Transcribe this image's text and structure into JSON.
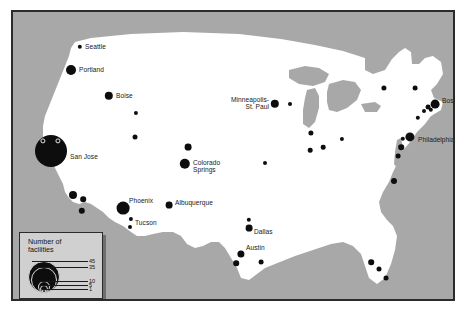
{
  "figure": {
    "kind": "thematic-map",
    "colors": {
      "page_background": "#ffffff",
      "ocean_background": "#a8a8a8",
      "land_fill": "#ffffff",
      "frame_border": "#2b2b2b",
      "symbol_fill": "#0d0d0d",
      "legend_background": "#d0d0d0",
      "legend_shadow": "#6f6f6f",
      "label_text": "#191919"
    }
  },
  "legend": {
    "title_line1": "Number of",
    "title_line2": "facilities",
    "breaks": [
      {
        "value": "45",
        "radius_px": 16.0
      },
      {
        "value": "35",
        "radius_px": 13.0
      },
      {
        "value": "10",
        "radius_px": 6.2
      },
      {
        "value": "5",
        "radius_px": 4.2
      },
      {
        "value": "1",
        "radius_px": 2.0
      }
    ]
  },
  "chart_data": {
    "type": "scatter",
    "xlabel": "",
    "ylabel": "",
    "symbol": "proportional-circle",
    "legend_position": "bottom-left",
    "points": [
      {
        "label": "Seattle",
        "x": 67,
        "y": 35,
        "r": 2.2,
        "label_pos": "right",
        "label_dx": 5,
        "label_dy": 0
      },
      {
        "label": "Portland",
        "x": 58,
        "y": 58,
        "r": 5.0,
        "label_pos": "right",
        "label_dx": 8,
        "label_dy": 0
      },
      {
        "label": "Boise",
        "x": 96,
        "y": 84,
        "r": 4.2,
        "label_pos": "right",
        "label_dx": 7,
        "label_dy": 0
      },
      {
        "label": "",
        "x": 123,
        "y": 101,
        "r": 2.1,
        "label_pos": "right",
        "label_dx": 0,
        "label_dy": 0
      },
      {
        "label": "",
        "x": 122,
        "y": 125,
        "r": 2.5,
        "label_pos": "right",
        "label_dx": 0,
        "label_dy": 0
      },
      {
        "label": "San Jose",
        "x": 38,
        "y": 139,
        "r": 16.0,
        "label_pos": "right",
        "label_dx": 19,
        "label_dy": 6
      },
      {
        "label": "",
        "x": 60,
        "y": 183,
        "r": 4.0,
        "label_pos": "right",
        "label_dx": 0,
        "label_dy": 0
      },
      {
        "label": "",
        "x": 70,
        "y": 187,
        "r": 2.8,
        "label_pos": "right",
        "label_dx": 0,
        "label_dy": 0
      },
      {
        "label": "",
        "x": 69,
        "y": 199,
        "r": 3.2,
        "label_pos": "right",
        "label_dx": 0,
        "label_dy": 0
      },
      {
        "label": "Phoenix",
        "x": 110,
        "y": 196,
        "r": 6.4,
        "label_pos": "right",
        "label_dx": 6,
        "label_dy": -7
      },
      {
        "label": "Tucson",
        "x": 118,
        "y": 207,
        "r": 2.1,
        "label_pos": "right",
        "label_dx": 4,
        "label_dy": 4
      },
      {
        "label": "",
        "x": 117,
        "y": 215,
        "r": 2.0,
        "label_pos": "right",
        "label_dx": 0,
        "label_dy": 0
      },
      {
        "label": "Albuquerque",
        "x": 156,
        "y": 193,
        "r": 3.4,
        "label_pos": "right",
        "label_dx": 6,
        "label_dy": -2
      },
      {
        "label": "Colorado\nSprings",
        "x": 172,
        "y": 152,
        "r": 5.2,
        "label_pos": "right",
        "label_dx": 8,
        "label_dy": 2
      },
      {
        "label": "",
        "x": 175,
        "y": 135,
        "r": 3.4,
        "label_pos": "right",
        "label_dx": 0,
        "label_dy": 0
      },
      {
        "label": "Minneapolis-\nSt. Paul",
        "x": 262,
        "y": 92,
        "r": 4.2,
        "label_pos": "left",
        "label_dx": -6,
        "label_dy": -1
      },
      {
        "label": "",
        "x": 277,
        "y": 92,
        "r": 2.0,
        "label_pos": "right",
        "label_dx": 0,
        "label_dy": 0
      },
      {
        "label": "",
        "x": 252,
        "y": 151,
        "r": 2.0,
        "label_pos": "right",
        "label_dx": 0,
        "label_dy": 0
      },
      {
        "label": "",
        "x": 298,
        "y": 121,
        "r": 2.6,
        "label_pos": "right",
        "label_dx": 0,
        "label_dy": 0
      },
      {
        "label": "",
        "x": 297,
        "y": 138,
        "r": 2.3,
        "label_pos": "right",
        "label_dx": 0,
        "label_dy": 0
      },
      {
        "label": "",
        "x": 310,
        "y": 135,
        "r": 2.3,
        "label_pos": "right",
        "label_dx": 0,
        "label_dy": 0
      },
      {
        "label": "",
        "x": 329,
        "y": 127,
        "r": 2.1,
        "label_pos": "right",
        "label_dx": 0,
        "label_dy": 0
      },
      {
        "label": "",
        "x": 236,
        "y": 208,
        "r": 2.2,
        "label_pos": "right",
        "label_dx": 0,
        "label_dy": 0
      },
      {
        "label": "Dallas",
        "x": 236,
        "y": 216,
        "r": 3.4,
        "label_pos": "right",
        "label_dx": 5,
        "label_dy": 4
      },
      {
        "label": "Austin",
        "x": 228,
        "y": 242,
        "r": 3.6,
        "label_pos": "right",
        "label_dx": 5,
        "label_dy": -6
      },
      {
        "label": "",
        "x": 223,
        "y": 251,
        "r": 2.8,
        "label_pos": "right",
        "label_dx": 0,
        "label_dy": 0
      },
      {
        "label": "",
        "x": 248,
        "y": 250,
        "r": 2.4,
        "label_pos": "right",
        "label_dx": 0,
        "label_dy": 0
      },
      {
        "label": "",
        "x": 358,
        "y": 250,
        "r": 2.8,
        "label_pos": "right",
        "label_dx": 0,
        "label_dy": 0
      },
      {
        "label": "",
        "x": 366,
        "y": 257,
        "r": 2.5,
        "label_pos": "right",
        "label_dx": 0,
        "label_dy": 0
      },
      {
        "label": "",
        "x": 373,
        "y": 266,
        "r": 2.5,
        "label_pos": "right",
        "label_dx": 0,
        "label_dy": 0
      },
      {
        "label": "",
        "x": 381,
        "y": 169,
        "r": 3.0,
        "label_pos": "right",
        "label_dx": 0,
        "label_dy": 0
      },
      {
        "label": "",
        "x": 385,
        "y": 144,
        "r": 2.4,
        "label_pos": "right",
        "label_dx": 0,
        "label_dy": 0
      },
      {
        "label": "Philadelphia",
        "x": 397,
        "y": 125,
        "r": 4.6,
        "label_pos": "right",
        "label_dx": 8,
        "label_dy": 3
      },
      {
        "label": "",
        "x": 388,
        "y": 135,
        "r": 2.8,
        "label_pos": "right",
        "label_dx": 0,
        "label_dy": 0
      },
      {
        "label": "",
        "x": 390,
        "y": 127,
        "r": 2.2,
        "label_pos": "right",
        "label_dx": 0,
        "label_dy": 0
      },
      {
        "label": "",
        "x": 405,
        "y": 106,
        "r": 2.2,
        "label_pos": "right",
        "label_dx": 0,
        "label_dy": 0
      },
      {
        "label": "",
        "x": 411,
        "y": 99,
        "r": 2.0,
        "label_pos": "right",
        "label_dx": 0,
        "label_dy": 0
      },
      {
        "label": "Boston",
        "x": 422,
        "y": 92,
        "r": 4.4,
        "label_pos": "right",
        "label_dx": 7,
        "label_dy": -3
      },
      {
        "label": "",
        "x": 415,
        "y": 95,
        "r": 2.4,
        "label_pos": "right",
        "label_dx": 0,
        "label_dy": 0
      },
      {
        "label": "",
        "x": 418,
        "y": 98,
        "r": 2.2,
        "label_pos": "right",
        "label_dx": 0,
        "label_dy": 0
      },
      {
        "label": "",
        "x": 402,
        "y": 76,
        "r": 2.4,
        "label_pos": "right",
        "label_dx": 0,
        "label_dy": 0
      },
      {
        "label": "",
        "x": 371,
        "y": 76,
        "r": 2.6,
        "label_pos": "right",
        "label_dx": 0,
        "label_dy": 0
      }
    ],
    "highlight_rings": [
      {
        "x": 30,
        "y": 129,
        "r": 2.6
      },
      {
        "x": 45,
        "y": 129,
        "r": 2.6
      }
    ]
  }
}
